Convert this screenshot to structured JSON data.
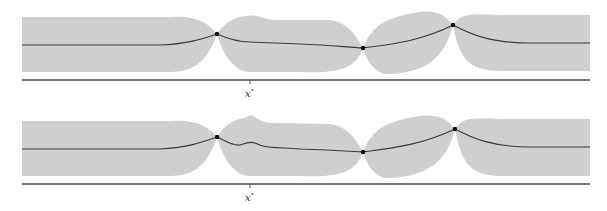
{
  "figure": {
    "panels": [
      {
        "name": "gp-posterior-top",
        "axis_label": "x",
        "axis_label_superscript": "*",
        "observations": [
          {
            "x": 217,
            "y": 34
          },
          {
            "x": 363,
            "y": 48
          },
          {
            "x": 453,
            "y": 25
          }
        ]
      },
      {
        "name": "gp-posterior-bottom",
        "axis_label": "x",
        "axis_label_superscript": "*",
        "observations": [
          {
            "x": 217,
            "y": 137
          },
          {
            "x": 363,
            "y": 152
          },
          {
            "x": 455,
            "y": 129
          }
        ]
      }
    ],
    "colors": {
      "band": "#cfcfcf",
      "mean": "#3a3a3a",
      "point": "#000000",
      "axis": "#4a4a4a"
    }
  }
}
